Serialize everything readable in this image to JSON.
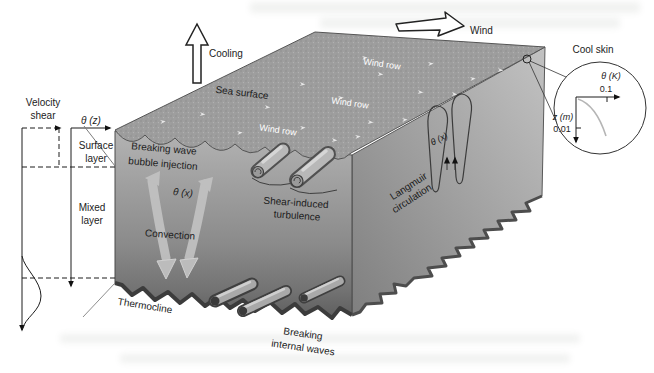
{
  "external": {
    "cooling_label": "Cooling",
    "wind_label": "Wind"
  },
  "surface": {
    "sea_surface_label": "Sea surface",
    "wind_rows": [
      "Wind row",
      "Wind row",
      "Wind row"
    ]
  },
  "profiles": {
    "velocity_shear": {
      "line1": "Velocity",
      "line2": "shear"
    },
    "theta_z": "θ (z)",
    "surface_layer": {
      "line1": "Surface",
      "line2": "layer"
    },
    "mixed_layer": {
      "line1": "Mixed",
      "line2": "layer"
    },
    "thermocline": "Thermocline"
  },
  "processes": {
    "breaking_wave": {
      "line1": "Breaking wave",
      "line2": "bubble injection"
    },
    "theta_x_front": "θ (x)",
    "convection": "Convection",
    "shear_turbulence": {
      "line1": "Shear-induced",
      "line2": "turbulence"
    },
    "langmuir": {
      "line1": "Langmuir",
      "line2": "circulation"
    },
    "theta_x_side": "θ (x)",
    "breaking_internal": {
      "line1": "Breaking",
      "line2": "internal waves"
    }
  },
  "inset": {
    "title": "Cool skin",
    "x_axis_label": "θ (K)",
    "x_tick": "0.1",
    "y_axis_label": "z (m)",
    "y_tick": "0.01"
  },
  "colors": {
    "sea_surface_base": "#9e9e9e",
    "front_face_top": "#b3b3b3",
    "front_face_bottom": "#5e5e5e",
    "side_face_light": "#c2c2c2",
    "side_face_dark": "#828282",
    "label_ink": "#1c1c1c",
    "wind_row_text": "#ffffff"
  }
}
